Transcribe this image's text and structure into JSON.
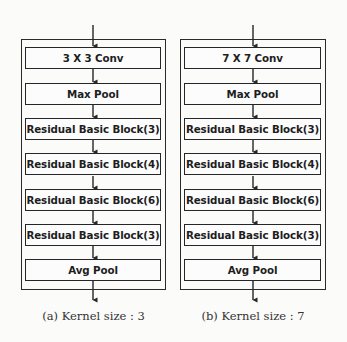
{
  "figure": {
    "panels": [
      {
        "id": "a",
        "caption": "(a) Kernel size : 3",
        "blocks": [
          "3 X 3 Conv",
          "Max Pool",
          "Residual Basic Block(3)",
          "Residual Basic Block(4)",
          "Residual Basic Block(6)",
          "Residual Basic Block(3)",
          "Avg Pool"
        ]
      },
      {
        "id": "b",
        "caption": "(b) Kernel size : 7",
        "blocks": [
          "7 X 7 Conv",
          "Max Pool",
          "Residual Basic Block(3)",
          "Residual Basic Block(4)",
          "Residual Basic Block(6)",
          "Residual Basic Block(3)",
          "Avg Pool"
        ]
      }
    ]
  },
  "colors": {
    "line": "#262626",
    "background": "#fbfbfa"
  }
}
